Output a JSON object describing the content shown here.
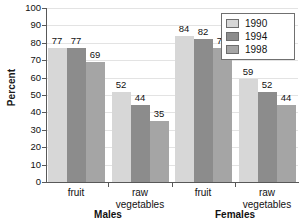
{
  "chart_data": {
    "type": "bar",
    "title": "",
    "xlabel": "",
    "ylabel": "Percent",
    "ylim": [
      0,
      100
    ],
    "ytick_step": 10,
    "yticks": [
      100,
      90,
      80,
      70,
      60,
      50,
      40,
      30,
      20,
      10,
      0
    ],
    "grid": true,
    "legend_position": "top-right",
    "categories": [
      "fruit",
      "raw vegetables",
      "fruit",
      "raw vegetables"
    ],
    "group_labels": [
      "Males",
      "Females"
    ],
    "series": [
      {
        "name": "1990",
        "color": "#d7d7d7",
        "values": [
          77,
          52,
          84,
          59
        ]
      },
      {
        "name": "1994",
        "color": "#8c8c8c",
        "values": [
          77,
          44,
          82,
          52
        ]
      },
      {
        "name": "1998",
        "color": "#a5a5a5",
        "values": [
          69,
          35,
          77,
          44
        ]
      }
    ],
    "bars": [
      {
        "group": "Males-fruit",
        "series": "1990",
        "value": 77,
        "label": "77"
      },
      {
        "group": "Males-fruit",
        "series": "1994",
        "value": 77,
        "label": "77"
      },
      {
        "group": "Males-fruit",
        "series": "1998",
        "value": 69,
        "label": "69"
      },
      {
        "group": "Males-raw-vegetables",
        "series": "1990",
        "value": 52,
        "label": "52"
      },
      {
        "group": "Males-raw-vegetables",
        "series": "1994",
        "value": 44,
        "label": "44"
      },
      {
        "group": "Males-raw-vegetables",
        "series": "1998",
        "value": 35,
        "label": "35"
      },
      {
        "group": "Females-fruit",
        "series": "1990",
        "value": 84,
        "label": "84"
      },
      {
        "group": "Females-fruit",
        "series": "1994",
        "value": 82,
        "label": "82"
      },
      {
        "group": "Females-fruit",
        "series": "1998",
        "value": 77,
        "label": "77"
      },
      {
        "group": "Females-raw-vegetables",
        "series": "1990",
        "value": 59,
        "label": "59"
      },
      {
        "group": "Females-raw-vegetables",
        "series": "1994",
        "value": 52,
        "label": "52"
      },
      {
        "group": "Females-raw-vegetables",
        "series": "1998",
        "value": 44,
        "label": "44"
      }
    ]
  },
  "axis": {
    "y_title": "Percent",
    "tick_labels": [
      "100",
      "90",
      "80",
      "70",
      "60",
      "50",
      "40",
      "30",
      "20",
      "10",
      "0"
    ]
  },
  "categories": [
    {
      "line1": "fruit",
      "line2": ""
    },
    {
      "line1": "raw",
      "line2": "vegetables"
    },
    {
      "line1": "fruit",
      "line2": ""
    },
    {
      "line1": "raw",
      "line2": "vegetables"
    }
  ],
  "groups": [
    {
      "label": "Males"
    },
    {
      "label": "Females"
    }
  ],
  "legend": {
    "items": [
      {
        "label": "1990",
        "color": "#d7d7d7"
      },
      {
        "label": "1994",
        "color": "#8c8c8c"
      },
      {
        "label": "1998",
        "color": "#a5a5a5"
      }
    ]
  }
}
